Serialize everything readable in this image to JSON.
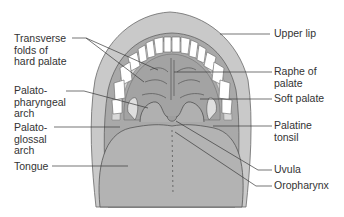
{
  "figure": {
    "colors": {
      "lip": "#c9c9c9",
      "lip_outline": "#6a6a6a",
      "gums": "#d8d8d8",
      "palate": "#a9a9a9",
      "tongue": "#b3b3b3",
      "teeth": "#ffffff",
      "tonsil": "#dedede",
      "leader_line": "#3a3a3a",
      "label_text": "#333333"
    },
    "labels_left": [
      {
        "id": "transverse-folds",
        "text": "Transverse\nfolds of\nhard palate"
      },
      {
        "id": "palatopharyngeal-arch",
        "text": "Palato-\npharyngeal\narch"
      },
      {
        "id": "palatoglossal-arch",
        "text": "Palato-\nglossal\narch"
      },
      {
        "id": "tongue",
        "text": "Tongue"
      }
    ],
    "labels_right": [
      {
        "id": "upper-lip",
        "text": "Upper lip"
      },
      {
        "id": "raphe-of-palate",
        "text": "Raphe of\npalate"
      },
      {
        "id": "soft-palate",
        "text": "Soft palate"
      },
      {
        "id": "palatine-tonsil",
        "text": "Palatine\ntonsil"
      },
      {
        "id": "uvula",
        "text": "Uvula"
      },
      {
        "id": "oropharynx",
        "text": "Oropharynx"
      }
    ]
  }
}
